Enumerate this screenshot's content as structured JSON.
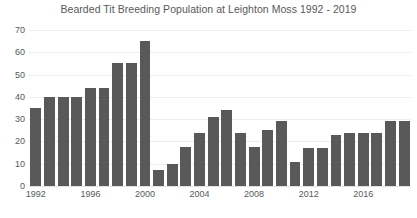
{
  "chart_data": {
    "type": "bar",
    "title": "Bearded Tit Breeding Population at Leighton Moss 1992 - 2019",
    "xlabel": "",
    "ylabel": "",
    "ylim": [
      0,
      70
    ],
    "ytick_step": 10,
    "yticks": [
      "70",
      "60",
      "50",
      "40",
      "30",
      "20",
      "10",
      "0"
    ],
    "grid": true,
    "legend": false,
    "bar_color": "#595959",
    "gridline_color": "#ededed",
    "background_color": "#ffffff",
    "text_color": "#595959",
    "xtick_labels": [
      "1992",
      "1996",
      "2000",
      "2004",
      "2008",
      "2012",
      "2016"
    ],
    "categories": [
      "1992",
      "1993",
      "1994",
      "1995",
      "1996",
      "1997",
      "1998",
      "1999",
      "2000",
      "2001",
      "2002",
      "2003",
      "2004",
      "2005",
      "2006",
      "2007",
      "2008",
      "2009",
      "2010",
      "2011",
      "2012",
      "2013",
      "2014",
      "2015",
      "2016",
      "2017",
      "2018",
      "2019"
    ],
    "values": [
      35,
      40,
      40,
      40,
      44,
      44,
      55,
      55,
      65,
      7,
      10,
      17.5,
      24,
      31,
      34,
      24,
      17.5,
      25,
      29,
      11,
      17,
      17,
      23,
      24,
      24,
      24,
      29,
      29
    ]
  }
}
